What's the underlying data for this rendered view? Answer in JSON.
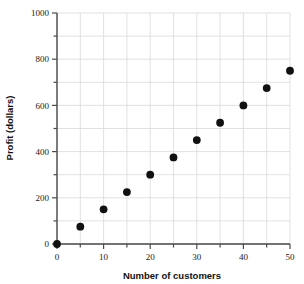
{
  "chart_data": {
    "type": "scatter",
    "title": "",
    "xlabel": "Number of customers",
    "ylabel": "Profit (dollars)",
    "xlim": [
      0,
      50
    ],
    "ylim": [
      0,
      1000
    ],
    "xticks": [
      0,
      10,
      20,
      30,
      40,
      50
    ],
    "xtick_labels": [
      "0",
      "10",
      "20",
      "30",
      "40",
      "50"
    ],
    "xminor_step": 5,
    "yticks": [
      0,
      200,
      400,
      600,
      800,
      1000
    ],
    "ytick_labels": [
      "0",
      "200",
      "400",
      "600",
      "800",
      "1000"
    ],
    "yminor_step": 100,
    "grid": true,
    "grid_color": "#d9d9d9",
    "legend": null,
    "marker": {
      "shape": "circle",
      "color": "#111111",
      "size_px": 5
    },
    "axis_color": "#4a4a4a",
    "x": [
      0,
      5,
      10,
      15,
      20,
      25,
      30,
      35,
      40,
      45,
      50
    ],
    "y": [
      0,
      75,
      150,
      225,
      300,
      375,
      450,
      525,
      600,
      675,
      750
    ],
    "points": [
      {
        "x": 0,
        "y": 0
      },
      {
        "x": 5,
        "y": 75
      },
      {
        "x": 10,
        "y": 150
      },
      {
        "x": 15,
        "y": 225
      },
      {
        "x": 20,
        "y": 300
      },
      {
        "x": 25,
        "y": 375
      },
      {
        "x": 30,
        "y": 450
      },
      {
        "x": 35,
        "y": 525
      },
      {
        "x": 40,
        "y": 600
      },
      {
        "x": 45,
        "y": 675
      },
      {
        "x": 50,
        "y": 750
      }
    ]
  }
}
